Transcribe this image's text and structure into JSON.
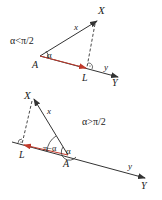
{
  "diagram_top": {
    "condition": "α<π/2",
    "points": {
      "A": "A",
      "X": "X",
      "L": "L",
      "Y": "Y"
    },
    "vector_labels": {
      "x": "x",
      "y": "y"
    },
    "angle_label": "α"
  },
  "diagram_bottom": {
    "condition": "α>π/2",
    "points": {
      "A": "A",
      "X": "X",
      "L": "L",
      "Y": "Y"
    },
    "vector_labels": {
      "x": "x",
      "y": "y"
    },
    "angle_label": "α",
    "supplement_label": "π−α"
  },
  "colors": {
    "line": "#333333",
    "projection_arrow": "#c0392b"
  }
}
